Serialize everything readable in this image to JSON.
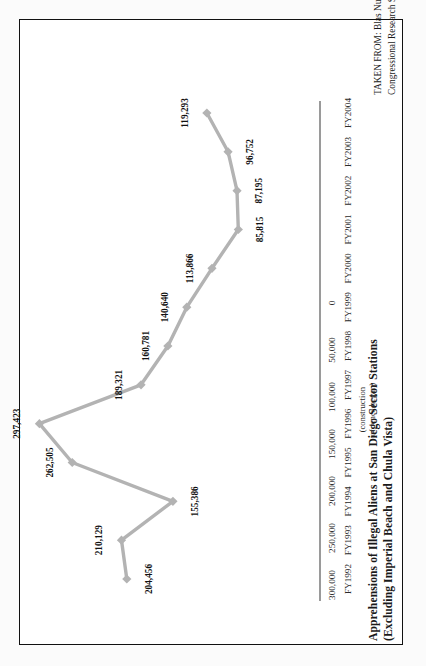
{
  "figure": {
    "title_line1": "Apprehensions of Illegal Aliens at San Diego Sector Stations",
    "title_line2": "(Excluding Imperial Beach and Chula Vista)",
    "citation_line1": "TAKEN FROM: Blas Nuñez-Neto and Yule Kim, “Border Security: Barriers along the U.S. International Border,”",
    "citation_line2": "Congressional Research Service Report for Congress, May 13, 2008.",
    "annotation_line1": "(construction",
    "annotation_line2": "of fence began)",
    "series_color": "#b3b3b3",
    "axis_color": "#9a9a9a",
    "frame_color": "#111111"
  },
  "chart_data": {
    "type": "line",
    "title": "Apprehensions of Illegal Aliens at San Diego Sector Stations (Excluding Imperial Beach and Chula Vista)",
    "xlabel": "",
    "ylabel": "",
    "ylim": [
      0,
      300000
    ],
    "grid": false,
    "legend": "none",
    "ytick_labels": [
      "0",
      "50,000",
      "100,000",
      "150,000",
      "200,000",
      "250,000",
      "300,000"
    ],
    "ytick_values": [
      0,
      50000,
      100000,
      150000,
      200000,
      250000,
      300000
    ],
    "categories": [
      "FY1992",
      "FY1993",
      "FY1994",
      "FY1995",
      "FY1996",
      "FY1997",
      "FY1998",
      "FY1999",
      "FY2000",
      "FY2001",
      "FY2002",
      "FY2003",
      "FY2004"
    ],
    "values": [
      204456,
      210129,
      155386,
      262505,
      297423,
      189321,
      160781,
      140640,
      113866,
      85815,
      87195,
      96752,
      119293
    ],
    "point_labels": [
      "204,456",
      "210,129",
      "155,386",
      "262,505",
      "297,423",
      "189,321",
      "160,781",
      "140,640",
      "113,866",
      "85,815",
      "87,195",
      "96,752",
      "119,293"
    ],
    "annotation": {
      "text": "(construction of fence began)",
      "at_category": "FY1996"
    }
  }
}
